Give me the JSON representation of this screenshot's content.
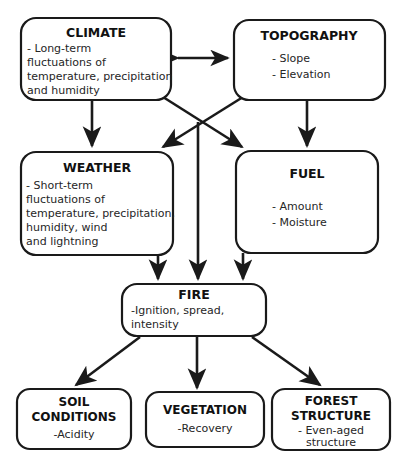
{
  "diagram": {
    "type": "flowchart",
    "colors": {
      "background": "#ffffff",
      "line": "#1a1a1a",
      "box_fill": "#ffffff",
      "text": "#111111"
    },
    "nodes": [
      {
        "id": "climate",
        "title": "CLIMATE",
        "lines": [
          "- Long-term",
          "fluctuations of",
          "temperature, precipitation",
          "and humidity"
        ],
        "align": "left"
      },
      {
        "id": "topography",
        "title": "TOPOGRAPHY",
        "lines": [
          "- Slope",
          "- Elevation"
        ],
        "align": "center"
      },
      {
        "id": "weather",
        "title": "WEATHER",
        "lines": [
          "- Short-term",
          "fluctuations of",
          "temperature, precipitation,",
          "humidity, wind",
          "and lightning"
        ],
        "align": "left"
      },
      {
        "id": "fuel",
        "title": "FUEL",
        "lines": [
          "- Amount",
          "- Moisture"
        ],
        "align": "center"
      },
      {
        "id": "fire",
        "title": "FIRE",
        "lines": [
          "-Ignition, spread,",
          "intensity"
        ],
        "align": "left"
      },
      {
        "id": "soil",
        "title": "SOIL",
        "title2": "CONDITIONS",
        "lines": [
          "-Acidity"
        ],
        "align": "center"
      },
      {
        "id": "vegetation",
        "title": "VEGETATION",
        "lines": [
          "-Recovery"
        ],
        "align": "center"
      },
      {
        "id": "forest",
        "title": "FOREST",
        "title2": "STRUCTURE",
        "lines": [
          "- Even-aged",
          "structure"
        ],
        "align": "center"
      }
    ],
    "edges": [
      {
        "id": "climate-topography",
        "from": "climate",
        "to": "topography",
        "arrow": "both"
      },
      {
        "id": "climate-weather",
        "from": "climate",
        "to": "weather",
        "arrow": "to"
      },
      {
        "id": "topography-fuel",
        "from": "topography",
        "to": "fuel",
        "arrow": "to"
      },
      {
        "id": "climate-fuel",
        "from": "climate",
        "to": "fuel",
        "arrow": "to"
      },
      {
        "id": "topography-weather",
        "from": "topography",
        "to": "weather",
        "arrow": "to"
      },
      {
        "id": "cross-fire",
        "from": "crossing",
        "to": "fire",
        "arrow": "to"
      },
      {
        "id": "weather-fire",
        "from": "weather",
        "to": "fire",
        "arrow": "to"
      },
      {
        "id": "fuel-fire",
        "from": "fuel",
        "to": "fire",
        "arrow": "to"
      },
      {
        "id": "fire-soil",
        "from": "fire",
        "to": "soil",
        "arrow": "to"
      },
      {
        "id": "fire-vegetation",
        "from": "fire",
        "to": "vegetation",
        "arrow": "to"
      },
      {
        "id": "fire-forest",
        "from": "fire",
        "to": "forest",
        "arrow": "to"
      }
    ]
  }
}
